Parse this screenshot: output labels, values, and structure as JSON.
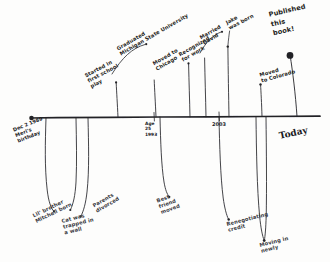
{
  "axis": {
    "start_label": "Dec 2 1989\nMeri's\nbirthday",
    "today_label": "Today",
    "ticks": [
      {
        "label": "Age\n25\n1993"
      },
      {
        "label": "2003"
      }
    ]
  },
  "events_above": [
    {
      "label": "Started in\nfirst school\nplay"
    },
    {
      "label": "Graduated\nMichigan State University"
    },
    {
      "label": "Moved to\nChicago"
    },
    {
      "label": "Recognized\nfor work"
    },
    {
      "label": "Married\nDavid"
    },
    {
      "label": "Jake\nwas born"
    },
    {
      "label": "Moved\nto Colorado"
    },
    {
      "label": "Published\nthis\nbook!"
    }
  ],
  "events_below": [
    {
      "label": "Lil' brother\nMitchell born"
    },
    {
      "label": "Parents\ndivorced"
    },
    {
      "label": "Cat was\ntrapped in\na wall"
    },
    {
      "label": "Best\nfriend\nmoved"
    },
    {
      "label": "Renegotiating\ncredit"
    },
    {
      "label": "Moving in\nnewly"
    }
  ],
  "colors": {
    "ink": "#1f1f22",
    "paper": "#fdfdfc"
  }
}
